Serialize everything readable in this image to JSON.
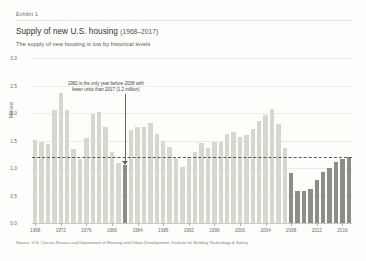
{
  "header": {
    "exhibit_label": "Exhibit 1",
    "title": "Supply of new U.S. housing",
    "title_years": "(1968–2017)",
    "subtitle": "The supply of new housing is low by historical levels"
  },
  "footer": {
    "source": "Source: U.S. Census Bureau and Department of Housing and Urban Development, Institute for Building Technology & Safety"
  },
  "annotation": {
    "line1": "1982 is the only year before 2008 with",
    "line2": "fewer units than 2017 (1.2 million)"
  },
  "colors": {
    "bar_normal": "#d8d7cd",
    "bar_highlight": "#8d8c85",
    "grid": "#ececE6",
    "axis": "#c9c8c1",
    "text": "#3c3c3c",
    "muted_text": "#6e6d67",
    "reference_line": "#5b5a54",
    "background": "#fdfdfc"
  },
  "chart_data": {
    "type": "bar",
    "title": "Supply of new U.S. housing (1968–2017)",
    "subtitle": "The supply of new housing is low by historical levels",
    "xlabel": "",
    "ylabel": "Millions",
    "ylim": [
      0,
      3.0
    ],
    "yticks": [
      "0.0",
      "0.5",
      "1.0",
      "1.5",
      "2.0",
      "2.5",
      "3.0"
    ],
    "ytick_values": [
      0.0,
      0.5,
      1.0,
      1.5,
      2.0,
      2.5,
      3.0
    ],
    "xticks": [
      "1968",
      "1972",
      "1976",
      "1980",
      "1984",
      "1988",
      "1992",
      "1996",
      "2000",
      "2004",
      "2008",
      "2012",
      "2016"
    ],
    "grid": true,
    "legend": "none",
    "reference_line": {
      "value": 1.2,
      "style": "dashed",
      "label": "2017 level (1.2 million)"
    },
    "highlight_years": [
      1982,
      2008,
      2009,
      2010,
      2011,
      2012,
      2013,
      2014,
      2015,
      2016,
      2017
    ],
    "categories": [
      1968,
      1969,
      1970,
      1971,
      1972,
      1973,
      1974,
      1975,
      1976,
      1977,
      1978,
      1979,
      1980,
      1981,
      1982,
      1983,
      1984,
      1985,
      1986,
      1987,
      1988,
      1989,
      1990,
      1991,
      1992,
      1993,
      1994,
      1995,
      1996,
      1997,
      1998,
      1999,
      2000,
      2001,
      2002,
      2003,
      2004,
      2005,
      2006,
      2007,
      2008,
      2009,
      2010,
      2011,
      2012,
      2013,
      2014,
      2015,
      2016,
      2017
    ],
    "values": [
      1.51,
      1.47,
      1.43,
      2.05,
      2.36,
      2.06,
      1.35,
      1.16,
      1.54,
      1.99,
      2.02,
      1.75,
      1.29,
      1.1,
      1.06,
      1.7,
      1.75,
      1.74,
      1.81,
      1.62,
      1.49,
      1.38,
      1.19,
      1.01,
      1.2,
      1.29,
      1.46,
      1.36,
      1.48,
      1.47,
      1.62,
      1.65,
      1.57,
      1.6,
      1.71,
      1.85,
      1.96,
      2.07,
      1.8,
      1.36,
      0.91,
      0.59,
      0.59,
      0.61,
      0.78,
      0.93,
      1.0,
      1.11,
      1.17,
      1.2
    ]
  }
}
